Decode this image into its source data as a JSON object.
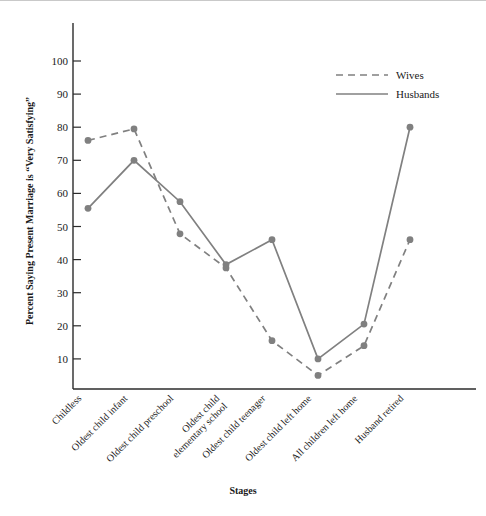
{
  "chart_data": {
    "type": "line",
    "title": "",
    "xlabel": "Stages",
    "ylabel": "Percent Saying Present Marriage is “Very Satisfying”",
    "categories": [
      "Childless",
      "Oldest child infant",
      "Oldest child preschool",
      "Oldest child elementary school",
      "Oldest child teenager",
      "Oldest child left home",
      "All children left home",
      "Husband retired"
    ],
    "series": [
      {
        "name": "Wives",
        "style": "dashed",
        "color": "#808080",
        "values": [
          76,
          79.5,
          47.8,
          37.5,
          15.5,
          5,
          14,
          46
        ]
      },
      {
        "name": "Husbands",
        "style": "solid",
        "color": "#808080",
        "values": [
          55.5,
          70,
          57.5,
          38.5,
          46,
          10,
          20.5,
          80
        ]
      }
    ],
    "ylim": [
      0,
      105
    ],
    "yticks": [
      10,
      20,
      30,
      40,
      50,
      60,
      70,
      80,
      90,
      100
    ],
    "ytick_labels": [
      "10",
      "20",
      "30",
      "40",
      "50",
      "60",
      "70",
      "80",
      "90",
      "100"
    ],
    "grid": false,
    "legend_position": "top-right",
    "legend_entries": [
      "Wives",
      "Husbands"
    ]
  },
  "legend": {
    "wives_label": "Wives",
    "husbands_label": "Husbands"
  },
  "axes": {
    "y_title": "Percent Saying Present Marriage is “Very Satisfying”",
    "x_title": "Stages"
  }
}
